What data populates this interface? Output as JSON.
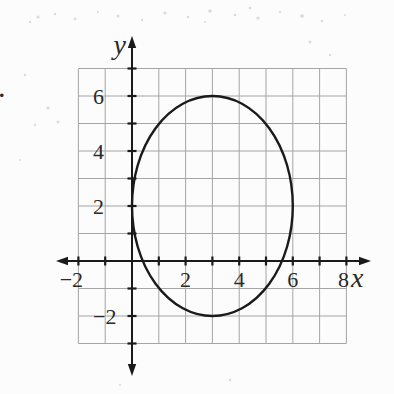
{
  "figure": {
    "stray_mark": "."
  },
  "chart_data": {
    "type": "line",
    "subtype": "ellipse-graph",
    "title": "",
    "grid": true,
    "x_grid_range": [
      -2,
      8
    ],
    "y_grid_range": [
      -3,
      7
    ],
    "ellipse": {
      "center_x": 3,
      "center_y": 2,
      "rx": 3,
      "ry": 4
    },
    "key_points": {
      "left_vertex": [
        0,
        2
      ],
      "right_vertex": [
        6,
        2
      ],
      "top_vertex": [
        3,
        6
      ],
      "bottom_vertex": [
        3,
        -2
      ]
    },
    "x_axis": {
      "label": "x",
      "tick_step": 1,
      "labeled_ticks": [
        -2,
        2,
        4,
        6,
        8
      ],
      "tick_labels": [
        "−2",
        "2",
        "4",
        "6",
        "8"
      ]
    },
    "y_axis": {
      "label": "y",
      "tick_step": 1,
      "labeled_ticks": [
        6,
        4,
        2,
        -2
      ],
      "tick_labels": [
        "6",
        "4",
        "2",
        "−2"
      ]
    },
    "colors": {
      "curve": "#1a1a1a",
      "axis": "#1a1a1a",
      "grid": "#909090",
      "label": "#2a2a2a",
      "noise": "#a8a8a8"
    }
  }
}
